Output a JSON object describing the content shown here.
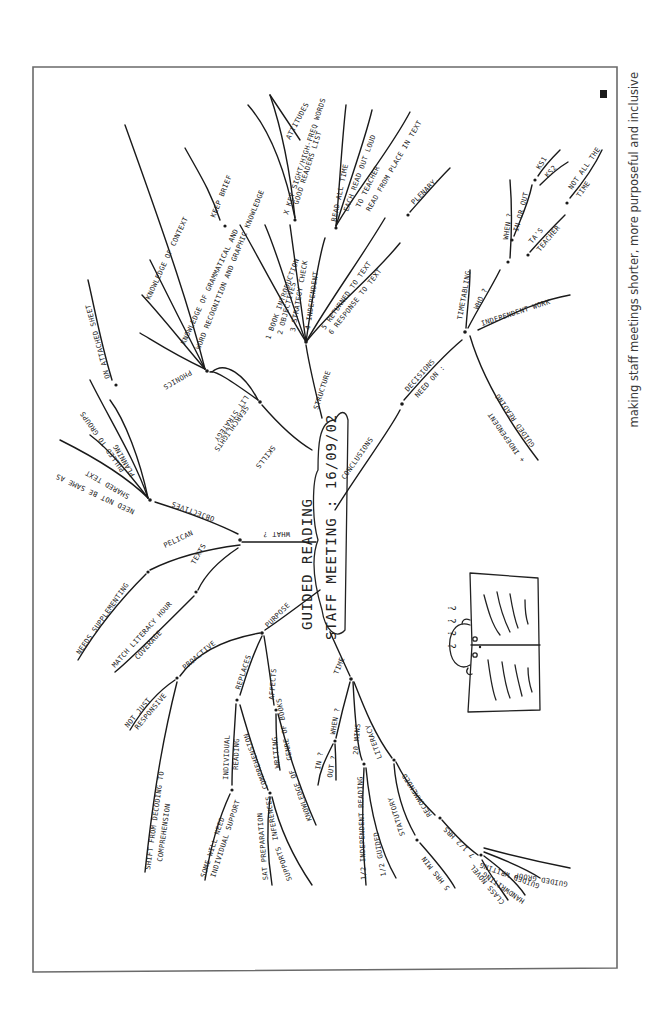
{
  "caption": "making staff meetings shorter, more purposeful and inclusive",
  "center": {
    "line1": "Guided Reading",
    "line2": "Staff Meeting : 16/09/02"
  },
  "branches": {
    "structure": {
      "label": "Structure",
      "children": [
        "1 Book introduction",
        "2 Objectives",
        "3 Strategy check",
        "4 Independent",
        "5 Returned to text",
        "6 Response to text"
      ],
      "strategy_check": [
        "x key sight/high-freq words",
        "Good readers list",
        "Attitudes"
      ],
      "independent": [
        "Read all time",
        "Each read out loud",
        "To teacher",
        "Read from place in text"
      ],
      "extra": "Plenary."
    },
    "skills": {
      "label": "Skills",
      "sub": [
        "Searchlights",
        "Lit strategy"
      ],
      "searchlights": [
        "Phonics",
        "Knowledge of context",
        "Knowledge of grammatical and",
        "Word recognition and graphic knowledge"
      ],
      "keep_brief": "Keep brief"
    },
    "what": {
      "label": "What ?",
      "objectives": {
        "label": "Objectives",
        "items": [
          "Need not be same as",
          "Shared text",
          "Pulled to groups",
          "Planning"
        ],
        "on_sheet": "On attached sheet"
      },
      "pelican": "Pelican",
      "needs": "Needs supplementing",
      "texts": "Texts",
      "match": [
        "Match literacy hour",
        "Coverage"
      ]
    },
    "purpose": {
      "label": "Purpose",
      "proactive": "Proactive",
      "not_just": [
        "Not just",
        "Responsive"
      ],
      "shift": [
        "Shift from decoding to",
        "comprehension"
      ],
      "replaces": "Replaces",
      "individual": [
        "Individual",
        "reading"
      ],
      "some_will_need": [
        "Some will need",
        "individual support"
      ],
      "comprehension": "Comprehension",
      "sat": [
        "SAT preparation",
        "Inferences"
      ],
      "supports": "Supports",
      "affects": "Affects",
      "writing": [
        "Writing",
        "Genre of books"
      ],
      "knowledge": "Knowledge of"
    },
    "time": {
      "label": "Time",
      "when": "When ?",
      "in_out": [
        "In ?",
        "Out ?"
      ],
      "mins": "20 mins",
      "literacy": "Literacy",
      "independent_reading": [
        "1/2 Independent reading",
        "1/2 Guided"
      ],
      "statutory": "Statutory",
      "recommended": "Recommended",
      "five_hrs": "5 hrs min",
      "seven_hrs": "7 1/2 hrs",
      "extras": [
        "Guided group",
        "Guided writing",
        "Handwriting",
        "Class novel"
      ]
    },
    "conclusions": {
      "label": "Conclusions",
      "decisions": [
        "Decisions",
        "Need on :"
      ],
      "timetabling": "Timetabling",
      "who": "Who ?",
      "when": "When ?",
      "in_or_out": "In or out",
      "ks1": "KS1",
      "ks2": "KS2",
      "not_all_time": [
        "Not all the",
        "time"
      ],
      "tas": [
        "TA's",
        "Teacher"
      ],
      "independent_work": "Independent work",
      "guided_reading": [
        "Guided reading",
        "+ independent"
      ]
    }
  },
  "drawing": {
    "question_marks": "? ? ? ?",
    "subject": "child reading open book"
  },
  "colors": {
    "ink": "#1a1a1a",
    "frame": "#6a6a6a",
    "caption": "#3a3a3a",
    "paper": "#ffffff"
  }
}
